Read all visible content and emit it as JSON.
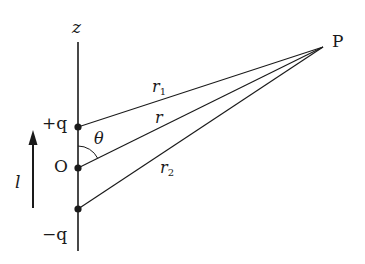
{
  "diagram": {
    "type": "electric-dipole-geometry",
    "axis_label": "z",
    "point_label": "P",
    "origin_label": "O",
    "charges": [
      {
        "label": "+q",
        "position": "top"
      },
      {
        "label": "−q",
        "position": "bottom"
      }
    ],
    "separation_label": "l",
    "angle_label": "θ",
    "distances": [
      {
        "label": "r",
        "sub": "1",
        "from": "+q",
        "to": "P"
      },
      {
        "label": "r",
        "sub": "",
        "from": "O",
        "to": "P"
      },
      {
        "label": "r",
        "sub": "2",
        "from": "−q",
        "to": "P"
      }
    ],
    "colors": {
      "ink": "#1a1a1a",
      "background": "#ffffff"
    }
  }
}
